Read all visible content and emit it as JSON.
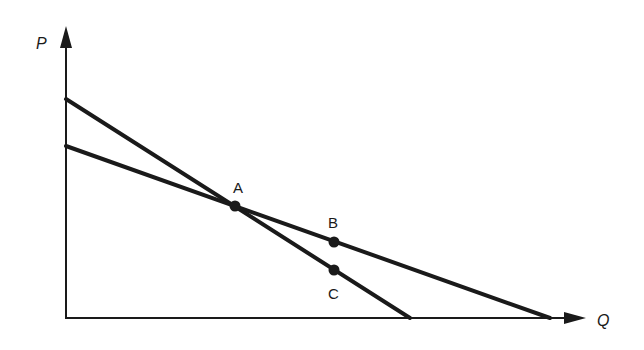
{
  "diagram": {
    "type": "supply-demand-style line diagram",
    "axes": {
      "y_label": "P",
      "x_label": "Q",
      "origin": [
        66,
        317
      ],
      "y_axis_top": 40,
      "x_axis_right": 590
    },
    "lines": [
      {
        "name": "steep-line",
        "from": [
          66,
          99
        ],
        "to": [
          410,
          318
        ]
      },
      {
        "name": "flat-line",
        "from": [
          66,
          146
        ],
        "to": [
          550,
          318
        ]
      }
    ],
    "points": [
      {
        "label": "A",
        "x": 235,
        "y": 206,
        "label_x": 234,
        "label_y": 192
      },
      {
        "label": "B",
        "x": 334,
        "y": 242,
        "label_x": 328,
        "label_y": 226
      },
      {
        "label": "C",
        "x": 334,
        "y": 270,
        "label_x": 328,
        "label_y": 298
      }
    ],
    "color": "#1a1a1a"
  }
}
